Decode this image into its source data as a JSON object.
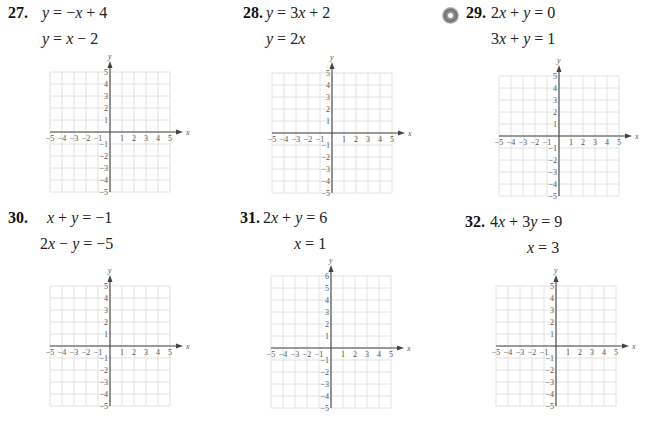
{
  "page": {
    "problems": [
      {
        "number": "27.",
        "equations": [
          "y = −x + 4",
          "y = x − 2"
        ],
        "has_cd_icon": false,
        "grid": {
          "xmin": -5,
          "xmax": 5,
          "ymin": -5,
          "ymax": 5,
          "x_label": "x",
          "y_label": "y"
        }
      },
      {
        "number": "28.",
        "equations": [
          "y = 3x + 2",
          "y = 2x"
        ],
        "has_cd_icon": false,
        "grid": {
          "xmin": -5,
          "xmax": 5,
          "ymin": -5,
          "ymax": 5,
          "x_label": "x",
          "y_label": "y"
        }
      },
      {
        "number": "29.",
        "equations": [
          "2x + y = 0",
          "3x + y = 1"
        ],
        "has_cd_icon": true,
        "icon": "cd-disc-icon",
        "grid": {
          "xmin": -5,
          "xmax": 5,
          "ymin": -5,
          "ymax": 5,
          "x_label": "x",
          "y_label": "y"
        }
      },
      {
        "number": "30.",
        "equations": [
          "x + y = −1",
          "2x − y = −5"
        ],
        "has_cd_icon": false,
        "grid": {
          "xmin": -5,
          "xmax": 5,
          "ymin": -5,
          "ymax": 5,
          "x_label": "x",
          "y_label": "y"
        }
      },
      {
        "number": "31.",
        "equations": [
          "2x + y = 6",
          "x = 1"
        ],
        "has_cd_icon": false,
        "grid": {
          "xmin": -5,
          "xmax": 5,
          "ymin": -5,
          "ymax": 6,
          "x_label": "x",
          "y_label": "y"
        }
      },
      {
        "number": "32.",
        "equations": [
          "4x + 3y = 9",
          "x = 3"
        ],
        "has_cd_icon": false,
        "grid": {
          "xmin": -5,
          "xmax": 5,
          "ymin": -5,
          "ymax": 5,
          "x_label": "x",
          "y_label": "y"
        }
      }
    ]
  },
  "colors": {
    "grid_line": "#e2e2e2",
    "axis": "#444444",
    "text": "#222222"
  }
}
